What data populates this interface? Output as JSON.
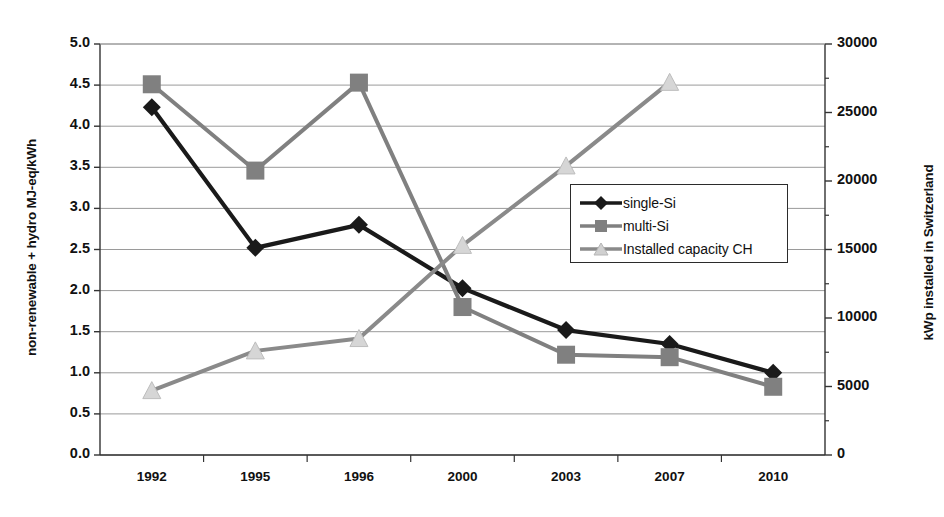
{
  "chart_data": {
    "type": "line",
    "title": "",
    "xlabel": "",
    "ylabel": "non-renewable + hydro MJ-eq/kWh",
    "y2label": "kWp installed in Switzerland",
    "categories": [
      "1992",
      "1995",
      "1996",
      "2000",
      "2003",
      "2007",
      "2010"
    ],
    "ylim": [
      0.0,
      5.0
    ],
    "y2lim": [
      0,
      30000
    ],
    "yticks": [
      "0.0",
      "0.5",
      "1.0",
      "1.5",
      "2.0",
      "2.5",
      "3.0",
      "3.5",
      "4.0",
      "4.5",
      "5.0"
    ],
    "y2ticks": [
      "0",
      "5000",
      "10000",
      "15000",
      "20000",
      "25000",
      "30000"
    ],
    "grid": true,
    "legend_position": "center-right-inside",
    "series": [
      {
        "name": "single-Si",
        "axis": "left",
        "marker": "diamond",
        "color": "#1a1a1a",
        "values": [
          4.23,
          2.52,
          2.8,
          2.03,
          1.52,
          1.35,
          1.0
        ]
      },
      {
        "name": "multi-Si",
        "axis": "left",
        "marker": "square",
        "color": "#808080",
        "values": [
          4.51,
          3.46,
          4.53,
          1.8,
          1.22,
          1.19,
          0.83
        ]
      },
      {
        "name": "Installed capacity CH",
        "axis": "right",
        "marker": "triangle",
        "color": "#8a8a8a",
        "values": [
          4700,
          7600,
          8500,
          15300,
          21100,
          27200,
          null
        ]
      }
    ]
  },
  "legend": {
    "items": [
      {
        "label": "single-Si"
      },
      {
        "label": "multi-Si"
      },
      {
        "label": "Installed capacity CH"
      }
    ]
  },
  "colors": {
    "single_si": "#1a1a1a",
    "multi_si": "#808080",
    "capacity": "#8a8a8a",
    "grid": "#9a9a9a",
    "axis": "#333333",
    "background": "#ffffff"
  }
}
